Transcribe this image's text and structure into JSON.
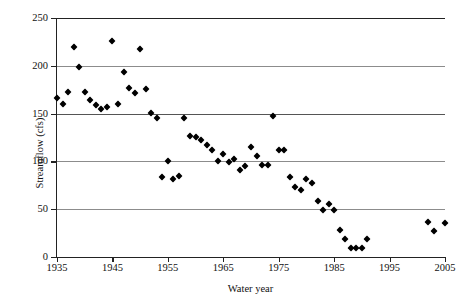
{
  "chart_data": {
    "type": "scatter",
    "title": "",
    "xlabel": "Water year",
    "ylabel": "Streamflow (cfs)",
    "xlim": [
      1935,
      2005
    ],
    "ylim": [
      0,
      250
    ],
    "xticks": [
      1935,
      1945,
      1955,
      1965,
      1975,
      1985,
      1995,
      2005
    ],
    "yticks": [
      0,
      50,
      100,
      150,
      200,
      250
    ],
    "grid": true,
    "grid_axis": "y",
    "legend": null,
    "marker": "diamond",
    "marker_color": "#000000",
    "series": [
      {
        "name": "Streamflow",
        "points": [
          {
            "x": 1935,
            "y": 166
          },
          {
            "x": 1936,
            "y": 160
          },
          {
            "x": 1937,
            "y": 173
          },
          {
            "x": 1938,
            "y": 220
          },
          {
            "x": 1939,
            "y": 199
          },
          {
            "x": 1940,
            "y": 173
          },
          {
            "x": 1941,
            "y": 164
          },
          {
            "x": 1942,
            "y": 159
          },
          {
            "x": 1943,
            "y": 155
          },
          {
            "x": 1944,
            "y": 157
          },
          {
            "x": 1945,
            "y": 226
          },
          {
            "x": 1946,
            "y": 160
          },
          {
            "x": 1947,
            "y": 194
          },
          {
            "x": 1948,
            "y": 177
          },
          {
            "x": 1949,
            "y": 172
          },
          {
            "x": 1950,
            "y": 218
          },
          {
            "x": 1951,
            "y": 176
          },
          {
            "x": 1952,
            "y": 151
          },
          {
            "x": 1953,
            "y": 145
          },
          {
            "x": 1954,
            "y": 84
          },
          {
            "x": 1955,
            "y": 100
          },
          {
            "x": 1956,
            "y": 82
          },
          {
            "x": 1957,
            "y": 85
          },
          {
            "x": 1958,
            "y": 145
          },
          {
            "x": 1959,
            "y": 127
          },
          {
            "x": 1960,
            "y": 126
          },
          {
            "x": 1961,
            "y": 122
          },
          {
            "x": 1962,
            "y": 117
          },
          {
            "x": 1963,
            "y": 112
          },
          {
            "x": 1964,
            "y": 100
          },
          {
            "x": 1965,
            "y": 108
          },
          {
            "x": 1966,
            "y": 99
          },
          {
            "x": 1967,
            "y": 102
          },
          {
            "x": 1968,
            "y": 91
          },
          {
            "x": 1969,
            "y": 95
          },
          {
            "x": 1970,
            "y": 115
          },
          {
            "x": 1971,
            "y": 106
          },
          {
            "x": 1972,
            "y": 96
          },
          {
            "x": 1973,
            "y": 96
          },
          {
            "x": 1974,
            "y": 148
          },
          {
            "x": 1975,
            "y": 112
          },
          {
            "x": 1976,
            "y": 112
          },
          {
            "x": 1977,
            "y": 84
          },
          {
            "x": 1978,
            "y": 73
          },
          {
            "x": 1979,
            "y": 70
          },
          {
            "x": 1980,
            "y": 82
          },
          {
            "x": 1981,
            "y": 77
          },
          {
            "x": 1982,
            "y": 59
          },
          {
            "x": 1983,
            "y": 49
          },
          {
            "x": 1984,
            "y": 55
          },
          {
            "x": 1985,
            "y": 49
          },
          {
            "x": 1986,
            "y": 28
          },
          {
            "x": 1987,
            "y": 19
          },
          {
            "x": 1988,
            "y": 9
          },
          {
            "x": 1989,
            "y": 9
          },
          {
            "x": 1990,
            "y": 9
          },
          {
            "x": 1991,
            "y": 19
          },
          {
            "x": 2002,
            "y": 37
          },
          {
            "x": 2003,
            "y": 27
          },
          {
            "x": 2005,
            "y": 36
          }
        ]
      }
    ]
  }
}
